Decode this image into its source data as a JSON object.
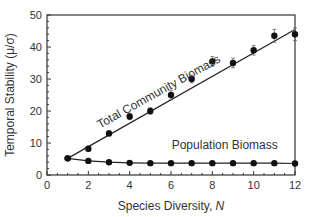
{
  "chart_data": {
    "type": "line",
    "title": "",
    "xlabel": "Species Diversity, N",
    "xlabel_main": "Species Diversity, ",
    "xlabel_italic": "N",
    "ylabel": "Temporal Stability (μ/σ)",
    "xlim": [
      0,
      12
    ],
    "ylim": [
      0,
      50
    ],
    "x_ticks": [
      0,
      2,
      4,
      6,
      8,
      10,
      12
    ],
    "y_ticks": [
      0,
      10,
      20,
      30,
      40,
      50
    ],
    "grid": false,
    "legend": "inline labels",
    "x": [
      1,
      2,
      3,
      4,
      5,
      6,
      7,
      8,
      9,
      10,
      11,
      12
    ],
    "series": [
      {
        "name": "Total Community Biomass",
        "values": [
          5.2,
          8.2,
          13.0,
          18.3,
          20.0,
          25.0,
          30.0,
          35.5,
          35.0,
          39.0,
          43.5,
          44.0
        ],
        "error": [
          0,
          0.8,
          0.8,
          1.0,
          1.0,
          1.5,
          1.2,
          1.5,
          1.5,
          1.5,
          2.0,
          2.0
        ],
        "fit": [
          [
            1,
            5.2
          ],
          [
            12,
            45.5
          ]
        ],
        "label_x": 5.5,
        "label_y": 25,
        "label_angle": -29
      },
      {
        "name": "Population Biomass",
        "values": [
          5.2,
          4.4,
          4.0,
          3.8,
          3.7,
          3.7,
          3.7,
          3.7,
          3.7,
          3.7,
          3.7,
          3.6
        ],
        "label_x": 8.6,
        "label_y": 8
      }
    ]
  }
}
